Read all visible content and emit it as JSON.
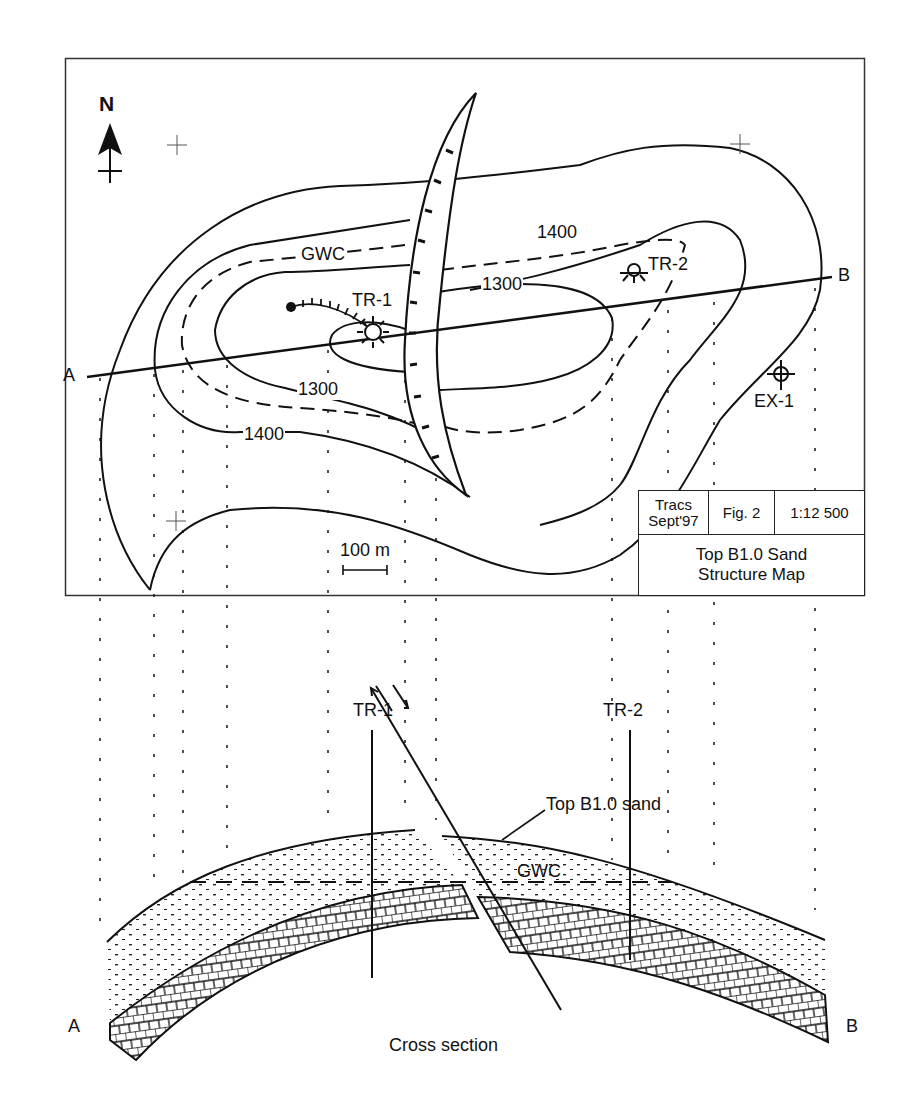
{
  "map": {
    "north_label": "N",
    "contour_labels": {
      "c1400_top": "1400",
      "c1300_top": "1300",
      "c1300_bottom": "1300",
      "c1400_bottom": "1400",
      "gwc": "GWC"
    },
    "wells": {
      "tr1": "TR-1",
      "tr2": "TR-2",
      "ex1": "EX-1"
    },
    "section_line": {
      "start": "A",
      "end": "B"
    },
    "scale_bar_label": "100 m"
  },
  "title_block": {
    "author_line1": "Tracs",
    "author_line2": "Sept'97",
    "figure": "Fig. 2",
    "scale": "1:12 500",
    "title_line1": "Top B1.0 Sand",
    "title_line2": "Structure Map"
  },
  "cross_section": {
    "well_tr1": "TR-1",
    "well_tr2": "TR-2",
    "horizon_label": "Top B1.0 sand",
    "gwc_label": "GWC",
    "end_a": "A",
    "end_b": "B",
    "caption": "Cross section"
  },
  "colors": {
    "ink": "#111111",
    "paper": "#ffffff"
  }
}
